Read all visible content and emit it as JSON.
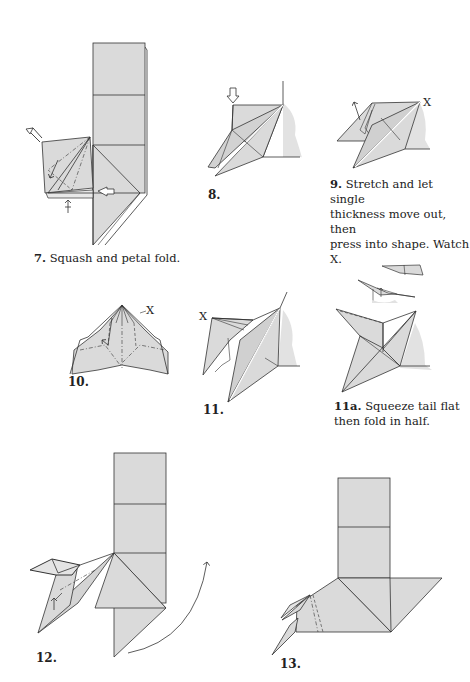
{
  "page": {
    "colors": {
      "paper_fill": "#dadada",
      "shadow_fill": "#e4e4e4",
      "line": "#333333",
      "background": "#ffffff"
    }
  },
  "steps": [
    {
      "id": "7",
      "number": "7.",
      "caption": "Squash and petal fold."
    },
    {
      "id": "8",
      "number": "8.",
      "caption": ""
    },
    {
      "id": "9",
      "number": "9.",
      "caption": "Stretch and let single thickness move out, then press into shape. Watch X.",
      "caption_lines": [
        "Stretch and let single",
        "thickness move out, then",
        "press into shape. Watch X."
      ],
      "marker": "X"
    },
    {
      "id": "10",
      "number": "10.",
      "caption": "",
      "marker": "X"
    },
    {
      "id": "11",
      "number": "11.",
      "caption": "",
      "marker": "X"
    },
    {
      "id": "11a",
      "number": "11a.",
      "caption": "Squeeze tail flat then fold in half.",
      "caption_lines": [
        "Squeeze tail flat",
        "then fold in half."
      ]
    },
    {
      "id": "12",
      "number": "12.",
      "caption": ""
    },
    {
      "id": "13",
      "number": "13.",
      "caption": ""
    }
  ]
}
